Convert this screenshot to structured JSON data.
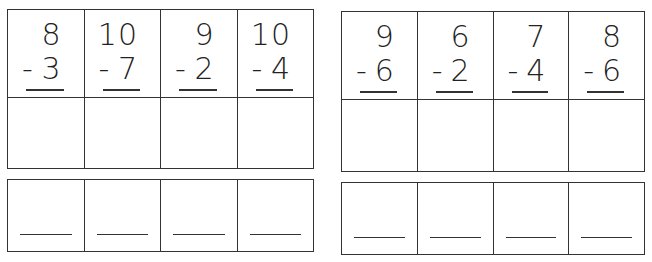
{
  "worksheet": {
    "left_set": {
      "problems": [
        {
          "top": "8",
          "bottom": "3",
          "op": "-"
        },
        {
          "top": "10",
          "bottom": "7",
          "op": "-"
        },
        {
          "top": "9",
          "bottom": "2",
          "op": "-"
        },
        {
          "top": "10",
          "bottom": "4",
          "op": "-"
        }
      ]
    },
    "right_set": {
      "problems": [
        {
          "top": "9",
          "bottom": "6",
          "op": "-"
        },
        {
          "top": "6",
          "bottom": "2",
          "op": "-"
        },
        {
          "top": "7",
          "bottom": "4",
          "op": "-"
        },
        {
          "top": "8",
          "bottom": "6",
          "op": "-"
        }
      ]
    },
    "colors": {
      "line": "#333333",
      "background": "#ffffff",
      "text": "#222222"
    }
  }
}
